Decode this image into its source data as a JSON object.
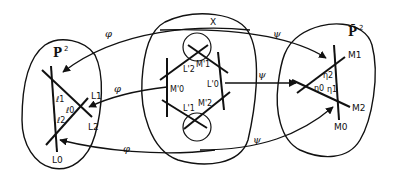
{
  "diagram": {
    "left_plane": {
      "title": "P",
      "title_sup": "2",
      "lines": [
        "L0",
        "L1",
        "L2"
      ],
      "points": [
        "ℓ1",
        "ℓ0",
        "ℓ2"
      ]
    },
    "center_space": {
      "title": "X",
      "lines": [
        "L'2",
        "L'0",
        "L'1"
      ],
      "points": [
        "M'1",
        "M'0",
        "M'2"
      ]
    },
    "right_plane": {
      "title": "P̄",
      "title_sup": "2",
      "lines": [
        "M1",
        "M2",
        "M0"
      ],
      "points": [
        "η2",
        "η0",
        "η1"
      ]
    },
    "maps": {
      "phi": "φ",
      "psi": "ψ"
    },
    "labels": {
      "L0": "L0",
      "L1": "L1",
      "L2": "L2",
      "l0": "ℓ0",
      "l1": "ℓ1",
      "l2": "ℓ2",
      "Lp0": "L'0",
      "Lp1": "L'1",
      "Lp2": "L'2",
      "Mp0": "M'0",
      "Mp1": "M'1",
      "Mp2": "M'2",
      "M0": "M0",
      "M1": "M1",
      "M2": "M2",
      "eta0": "η0",
      "eta1": "η1",
      "eta2": "η2",
      "X": "X",
      "P": "P",
      "Pbar": "P̄",
      "sup2": "2"
    },
    "colors": {
      "ink": "#111111",
      "paper": "#ffffff"
    }
  }
}
